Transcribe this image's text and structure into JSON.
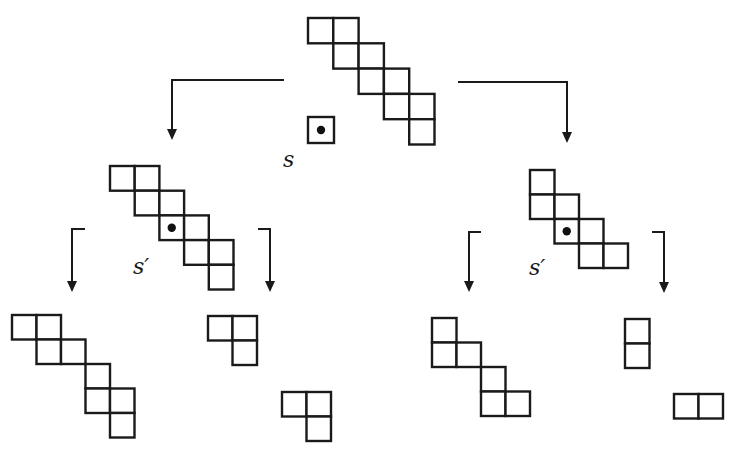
{
  "diagram": {
    "title": "",
    "labels": [
      {
        "id": "s",
        "text": "s",
        "x": 283,
        "y": 167
      },
      {
        "id": "s-prime-left",
        "text": "s′",
        "x": 133,
        "y": 274
      },
      {
        "id": "s-prime-right",
        "text": "s′",
        "x": 529,
        "y": 275
      }
    ],
    "shapes": [
      {
        "id": "root-shape",
        "x": 308,
        "y": 18,
        "cell": 25.3,
        "cells": [
          [
            0,
            0
          ],
          [
            0,
            1
          ],
          [
            1,
            1
          ],
          [
            1,
            2
          ],
          [
            2,
            2
          ],
          [
            2,
            3
          ],
          [
            3,
            3
          ],
          [
            3,
            4
          ],
          [
            4,
            4
          ]
        ],
        "dot": null
      },
      {
        "id": "marked-cell-s",
        "x": 308,
        "y": 117,
        "cell": 26,
        "cells": [
          [
            0,
            0
          ]
        ],
        "dot": [
          0,
          0
        ]
      },
      {
        "id": "left-child-shape",
        "x": 110,
        "y": 166,
        "cell": 24.7,
        "cells": [
          [
            0,
            0
          ],
          [
            0,
            1
          ],
          [
            1,
            1
          ],
          [
            1,
            2
          ],
          [
            2,
            2
          ],
          [
            2,
            3
          ],
          [
            3,
            3
          ],
          [
            3,
            4
          ],
          [
            4,
            4
          ]
        ],
        "dot": [
          2,
          2
        ]
      },
      {
        "id": "right-child-shape",
        "x": 530,
        "y": 170,
        "cell": 24.5,
        "cells": [
          [
            0,
            0
          ],
          [
            1,
            0
          ],
          [
            1,
            1
          ],
          [
            2,
            1
          ],
          [
            2,
            2
          ],
          [
            3,
            2
          ],
          [
            3,
            3
          ]
        ],
        "dot": [
          2,
          1
        ]
      },
      {
        "id": "left-left-result",
        "x": 12,
        "y": 315,
        "cell": 24.5,
        "cells": [
          [
            0,
            0
          ],
          [
            0,
            1
          ],
          [
            1,
            1
          ],
          [
            1,
            2
          ],
          [
            2,
            3
          ],
          [
            3,
            3
          ],
          [
            3,
            4
          ],
          [
            4,
            4
          ]
        ],
        "dot": null
      },
      {
        "id": "left-right-result-a",
        "x": 208,
        "y": 316,
        "cell": 24.5,
        "cells": [
          [
            0,
            0
          ],
          [
            0,
            1
          ],
          [
            1,
            1
          ]
        ],
        "dot": null
      },
      {
        "id": "left-right-result-b",
        "x": 282,
        "y": 392,
        "cell": 24.5,
        "cells": [
          [
            0,
            0
          ],
          [
            0,
            1
          ],
          [
            1,
            1
          ]
        ],
        "dot": null
      },
      {
        "id": "right-left-result",
        "x": 432,
        "y": 318,
        "cell": 24.5,
        "cells": [
          [
            0,
            0
          ],
          [
            1,
            0
          ],
          [
            1,
            1
          ],
          [
            2,
            2
          ],
          [
            3,
            2
          ],
          [
            3,
            3
          ]
        ],
        "dot": null
      },
      {
        "id": "right-right-result-a",
        "x": 625,
        "y": 319,
        "cell": 24.5,
        "cells": [
          [
            0,
            0
          ],
          [
            1,
            0
          ]
        ],
        "dot": null
      },
      {
        "id": "right-right-result-b",
        "x": 674,
        "y": 394,
        "cell": 24.5,
        "cells": [
          [
            0,
            0
          ],
          [
            0,
            1
          ]
        ],
        "dot": null
      }
    ],
    "arrows": [
      {
        "id": "arrow-root-to-left",
        "points": [
          [
            284,
            80
          ],
          [
            172,
            80
          ],
          [
            172,
            140
          ]
        ]
      },
      {
        "id": "arrow-root-to-right",
        "points": [
          [
            458,
            82
          ],
          [
            567,
            82
          ],
          [
            567,
            143
          ]
        ]
      },
      {
        "id": "arrow-left-to-left",
        "points": [
          [
            85,
            229
          ],
          [
            72,
            229
          ],
          [
            72,
            292
          ]
        ]
      },
      {
        "id": "arrow-left-to-right",
        "points": [
          [
            258,
            229
          ],
          [
            270,
            229
          ],
          [
            270,
            292
          ]
        ]
      },
      {
        "id": "arrow-right-to-left",
        "points": [
          [
            481,
            232
          ],
          [
            469,
            232
          ],
          [
            469,
            292
          ]
        ]
      },
      {
        "id": "arrow-right-to-right",
        "points": [
          [
            652,
            232
          ],
          [
            664,
            232
          ],
          [
            664,
            293
          ]
        ]
      }
    ]
  }
}
